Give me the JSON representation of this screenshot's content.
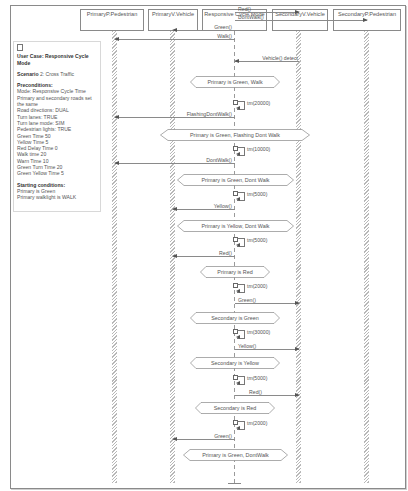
{
  "lifelines": [
    {
      "label": "PrimaryP.Pedestrian",
      "x": 115
    },
    {
      "label": "PrimaryV.Vehicle",
      "x": 173
    },
    {
      "label": "Responsive Cycle Mode",
      "x": 235
    },
    {
      "label": "SecondaryV.Vehicle",
      "x": 299
    },
    {
      "label": "SecondaryP.Pedestrian",
      "x": 367
    }
  ],
  "note": {
    "title": "User Case: Responsive Cycle Mode",
    "scenario_label": "Scenario",
    "scenario_value": "2: Cross Traffic",
    "preconditions_label": "Preconditions:",
    "preconditions": [
      "Mode: Responsive Cycle Time",
      "Primary and secondary roads set the same",
      "Road directions: DUAL",
      "Turn lanes: TRUE",
      "Turn lane mode: SIM",
      "Pedestrian lights: TRUE",
      "Green Time 50",
      "Yellow Time 5",
      "Red Delay Time 0",
      "Walk time 20",
      "Warn Time 10",
      "Green Turn Time 20",
      "Green Yellow Time 5"
    ],
    "starting_label": "Starting conditions:",
    "starting": [
      "Primary is Green",
      "Primary walklight is WALK"
    ]
  },
  "messages": [
    {
      "label": "Red()",
      "y": 12,
      "from": 235,
      "to": 299
    },
    {
      "label": "DontWalk()",
      "y": 20,
      "from": 235,
      "to": 367
    },
    {
      "label": "Green()",
      "y": 30,
      "from": 235,
      "to": 173
    },
    {
      "label": "Walk()",
      "y": 39,
      "from": 235,
      "to": 115
    },
    {
      "label": "Vehicle() detect",
      "y": 61,
      "from": 299,
      "to": 235
    },
    {
      "label": "FlashingDontWalk()",
      "y": 117,
      "from": 235,
      "to": 115
    },
    {
      "label": "DontWalk()",
      "y": 163,
      "from": 235,
      "to": 115
    },
    {
      "label": "Yellow()",
      "y": 209,
      "from": 235,
      "to": 173
    },
    {
      "label": "Red()",
      "y": 256,
      "from": 235,
      "to": 173
    },
    {
      "label": "Green()",
      "y": 303,
      "from": 235,
      "to": 299
    },
    {
      "label": "Yellow()",
      "y": 349,
      "from": 235,
      "to": 299
    },
    {
      "label": "Red()",
      "y": 395,
      "from": 235,
      "to": 299
    },
    {
      "label": "Green()",
      "y": 439,
      "from": 235,
      "to": 173
    }
  ],
  "states": [
    {
      "label": "Primary is Green, Walk",
      "y": 76,
      "left": 190,
      "width": 90
    },
    {
      "label": "Primary is Green, Flashing Dont Walk",
      "y": 129,
      "left": 160,
      "width": 150
    },
    {
      "label": "Primary is Green, Dont Walk",
      "y": 174,
      "left": 177,
      "width": 117
    },
    {
      "label": "Primary is Yellow, Dont Walk",
      "y": 220,
      "left": 177,
      "width": 117
    },
    {
      "label": "Primary is Red",
      "y": 266,
      "left": 200,
      "width": 70
    },
    {
      "label": "Secondary is Green",
      "y": 312,
      "left": 190,
      "width": 90
    },
    {
      "label": "Secondary is Yellow",
      "y": 357,
      "left": 190,
      "width": 90
    },
    {
      "label": "Secondary is Red",
      "y": 402,
      "left": 195,
      "width": 80
    },
    {
      "label": "Primary is Green, DontWalk",
      "y": 449,
      "left": 183,
      "width": 105
    }
  ],
  "timers": [
    {
      "label": "tm(20000)",
      "y": 102
    },
    {
      "label": "tm(10000)",
      "y": 148
    },
    {
      "label": "tm(5000)",
      "y": 193
    },
    {
      "label": "tm(5000)",
      "y": 239
    },
    {
      "label": "tm(2000)",
      "y": 284
    },
    {
      "label": "tm(30000)",
      "y": 331
    },
    {
      "label": "tm(5000)",
      "y": 377
    },
    {
      "label": "tm(2000)",
      "y": 422
    }
  ],
  "colors": {
    "line": "#8a8a8a",
    "text": "#555555",
    "hatch": "#b8b8b8"
  }
}
